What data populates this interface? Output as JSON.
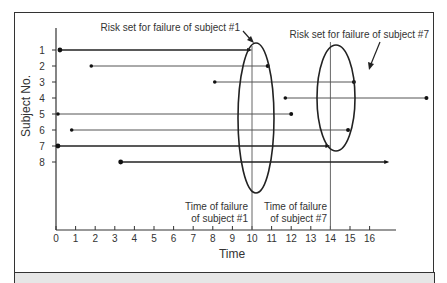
{
  "chart_data": {
    "type": "diagram",
    "title": "",
    "xlabel": "Time",
    "ylabel": "Subject No.",
    "x_ticks": [
      0,
      1,
      2,
      3,
      4,
      5,
      6,
      7,
      8,
      9,
      10,
      11,
      12,
      13,
      14,
      15,
      16
    ],
    "y_ticks": [
      1,
      2,
      3,
      4,
      5,
      6,
      7,
      8
    ],
    "xlim": [
      0,
      19
    ],
    "subjects": [
      {
        "id": 1,
        "start": 0.2,
        "end": 9.9,
        "event": "failure",
        "heavy": true
      },
      {
        "id": 2,
        "start": 1.8,
        "end": 10.8,
        "event": "censored",
        "heavy": false
      },
      {
        "id": 3,
        "start": 8.1,
        "end": 15.2,
        "event": "censored",
        "heavy": false
      },
      {
        "id": 4,
        "start": 11.7,
        "end": 18.9,
        "event": "censored",
        "heavy": false
      },
      {
        "id": 5,
        "start": 0.1,
        "end": 12.0,
        "event": "censored",
        "heavy": false
      },
      {
        "id": 6,
        "start": 0.8,
        "end": 14.9,
        "event": "censored",
        "heavy": false
      },
      {
        "id": 7,
        "start": 0.1,
        "end": 13.9,
        "event": "failure",
        "heavy": true
      },
      {
        "id": 8,
        "start": 3.3,
        "end": 16.9,
        "event": "failure",
        "heavy": true
      }
    ],
    "failure_times": [
      {
        "time": 10,
        "label_line1": "Time of failure",
        "label_line2": "of subject #1"
      },
      {
        "time": 14,
        "label_line1": "Time of failure",
        "label_line2": "of subject #7"
      }
    ],
    "annotations": [
      {
        "text": "Risk set for failure of subject #1"
      },
      {
        "text": "Risk set for failure of subject #7"
      }
    ]
  }
}
